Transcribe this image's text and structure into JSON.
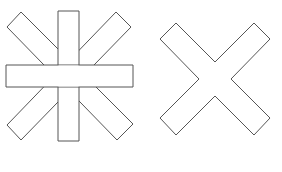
{
  "diagram": {
    "background": "#ffffff",
    "stroke_color": "#555555",
    "fill_color": "#ffffff",
    "shapes": [
      {
        "name": "asterisk-shape",
        "description": "eight-armed asterisk / star outline"
      },
      {
        "name": "x-shape",
        "description": "diagonal cross (X) outline"
      }
    ]
  }
}
